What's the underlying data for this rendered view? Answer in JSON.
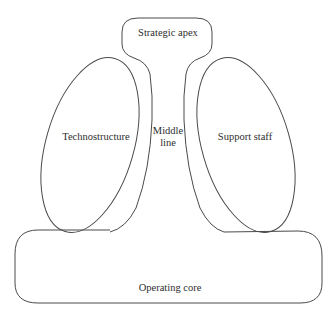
{
  "diagram": {
    "type": "organizational-structure",
    "parts": {
      "strategic_apex": {
        "label": "Strategic apex"
      },
      "middle_line": {
        "label": "Middle\nline",
        "line1": "Middle",
        "line2": "line"
      },
      "technostructure": {
        "label": "Technostructure"
      },
      "support_staff": {
        "label": "Support staff"
      },
      "operating_core": {
        "label": "Operating core"
      }
    },
    "colors": {
      "stroke": "#4a4a4a",
      "text": "#2e2e2e",
      "background": "#ffffff"
    }
  }
}
